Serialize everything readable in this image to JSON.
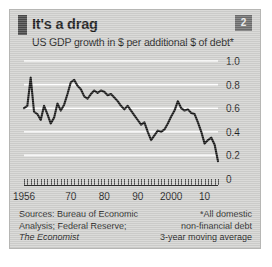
{
  "card": {
    "badge_number": "2",
    "accent_color": "#4a4a4a",
    "background_color": "#d2d2d0",
    "line_color": "#1a1a1a",
    "gridline_color": "#ffffff"
  },
  "footer": {
    "sources_line1": "Sources: Bureau of Economic",
    "sources_line2": "Analysis; Federal Reserve;",
    "sources_line3": "The Economist",
    "note_line1": "*All domestic",
    "note_line2": "non-financial debt",
    "note_line3": "3-year moving average"
  },
  "chart_data": {
    "type": "line",
    "title": "It's a drag",
    "subtitle": "US GDP growth in $ per additional $ of debt*",
    "xlabel": "",
    "ylabel": "",
    "xlim": [
      1956,
      2014
    ],
    "ylim": [
      0,
      1.0
    ],
    "grid": true,
    "legend": "none",
    "y_ticks": [
      0,
      0.2,
      0.4,
      0.6,
      0.8,
      1.0
    ],
    "y_tick_labels": [
      "0",
      "0.2",
      "0.4",
      "0.6",
      "0.8",
      "1.0"
    ],
    "x_ticks": [
      1956,
      1970,
      1980,
      1990,
      2000,
      2010
    ],
    "x_tick_labels": [
      "1956",
      "70",
      "80",
      "90",
      "2000",
      "10"
    ],
    "x_minor_tick_interval": 1,
    "series": [
      {
        "name": "US GDP growth per additional $ of debt",
        "x": [
          1956,
          1957,
          1958,
          1959,
          1960,
          1961,
          1962,
          1963,
          1964,
          1965,
          1966,
          1967,
          1968,
          1969,
          1970,
          1971,
          1972,
          1973,
          1974,
          1975,
          1976,
          1977,
          1978,
          1979,
          1980,
          1981,
          1982,
          1983,
          1984,
          1985,
          1986,
          1987,
          1988,
          1989,
          1990,
          1991,
          1992,
          1993,
          1994,
          1995,
          1996,
          1997,
          1998,
          1999,
          2000,
          2001,
          2002,
          2003,
          2004,
          2005,
          2006,
          2007,
          2008,
          2009,
          2010,
          2011,
          2012,
          2013,
          2014
        ],
        "values": [
          0.6,
          0.62,
          0.86,
          0.57,
          0.55,
          0.5,
          0.62,
          0.55,
          0.47,
          0.52,
          0.64,
          0.58,
          0.63,
          0.72,
          0.82,
          0.84,
          0.79,
          0.76,
          0.7,
          0.68,
          0.72,
          0.75,
          0.73,
          0.75,
          0.74,
          0.71,
          0.72,
          0.69,
          0.66,
          0.62,
          0.59,
          0.62,
          0.58,
          0.54,
          0.5,
          0.46,
          0.48,
          0.4,
          0.33,
          0.37,
          0.41,
          0.4,
          0.42,
          0.47,
          0.53,
          0.58,
          0.66,
          0.6,
          0.58,
          0.59,
          0.56,
          0.55,
          0.48,
          0.4,
          0.3,
          0.33,
          0.35,
          0.29,
          0.15
        ]
      }
    ]
  }
}
